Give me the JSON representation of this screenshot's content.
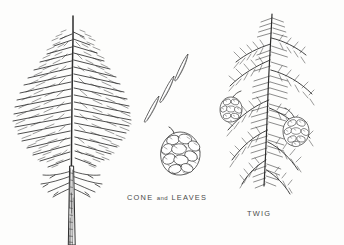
{
  "plate": {
    "background_color": "#fdfdfc",
    "ink_color": "#2e2e2e",
    "medium": "pen-and-ink botanical illustration"
  },
  "figures": [
    {
      "name": "whole-tree",
      "subject": "conifer tree, full habit",
      "description": "tall narrow evergreen with drooping layered branches and bare lower trunk",
      "caption": ""
    },
    {
      "name": "cone-and-leaves",
      "subject": "seed cone with three detached needle leaves",
      "description": "three slender needles arranged diagonally above a rounded scaled cone",
      "needle_count": 3,
      "cone_count": 1
    },
    {
      "name": "twig",
      "subject": "needled twig bearing cones",
      "description": "branchlet with flat spreading needles and two small cones",
      "cone_count": 2
    }
  ],
  "captions": {
    "cone_and_leaves": {
      "part1": "CONE",
      "connector": "and",
      "part2": "LEAVES"
    },
    "twig": "TWIG"
  }
}
